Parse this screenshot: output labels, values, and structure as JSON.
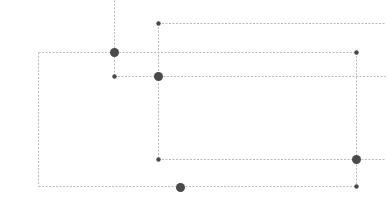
{
  "diagram": {
    "type": "tree-layout",
    "colors": {
      "edge": "#bdbdbd",
      "node": "#4a4a4a",
      "background": "#ffffff"
    },
    "nodes": [
      {
        "id": "n1",
        "x": 114,
        "y": 52,
        "r": 4.5,
        "size": "large"
      },
      {
        "id": "n2",
        "x": 114,
        "y": 76,
        "r": 2.2,
        "size": "small"
      },
      {
        "id": "n3",
        "x": 158,
        "y": 23,
        "r": 2.2,
        "size": "small"
      },
      {
        "id": "n4",
        "x": 158,
        "y": 76,
        "r": 4.5,
        "size": "large"
      },
      {
        "id": "n5",
        "x": 158,
        "y": 159,
        "r": 2.2,
        "size": "small"
      },
      {
        "id": "n6",
        "x": 356,
        "y": 52,
        "r": 2.2,
        "size": "small"
      },
      {
        "id": "n7",
        "x": 356,
        "y": 159,
        "r": 4.5,
        "size": "large"
      },
      {
        "id": "n8",
        "x": 356,
        "y": 186,
        "r": 2.2,
        "size": "small"
      },
      {
        "id": "n9",
        "x": 180,
        "y": 187,
        "r": 4.5,
        "size": "large"
      }
    ],
    "edges": [
      {
        "id": "e1",
        "x1": 114,
        "y1": 0,
        "x2": 114,
        "y2": 76
      },
      {
        "id": "e2",
        "x1": 38,
        "y1": 52,
        "x2": 356,
        "y2": 52
      },
      {
        "id": "e3",
        "x1": 114,
        "y1": 76,
        "x2": 385,
        "y2": 76
      },
      {
        "id": "e4",
        "x1": 158,
        "y1": 23,
        "x2": 385,
        "y2": 23
      },
      {
        "id": "e5",
        "x1": 158,
        "y1": 23,
        "x2": 158,
        "y2": 159
      },
      {
        "id": "e6",
        "x1": 158,
        "y1": 159,
        "x2": 385,
        "y2": 159
      },
      {
        "id": "e7",
        "x1": 356,
        "y1": 52,
        "x2": 356,
        "y2": 186
      },
      {
        "id": "e8",
        "x1": 38,
        "y1": 52,
        "x2": 38,
        "y2": 186
      },
      {
        "id": "e9",
        "x1": 38,
        "y1": 186,
        "x2": 356,
        "y2": 186
      }
    ]
  }
}
